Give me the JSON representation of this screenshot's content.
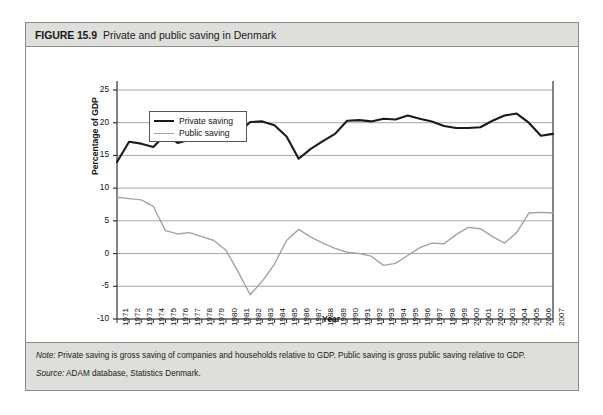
{
  "figure": {
    "number": "FIGURE 15.9",
    "title": "Private and public saving in Denmark",
    "note_label": "Note:",
    "note_text": " Private saving is gross saving of companies and households relative to GDP. Public saving is gross public saving relative to GDP.",
    "source_label": "Source:",
    "source_text": " ADAM database, Statistics Denmark."
  },
  "colors": {
    "private_line": "#1a1a1a",
    "public_line": "#a3a3a3",
    "gridline": "#a8a8a8",
    "axis": "#333333",
    "header_bg": "#dededa",
    "border": "#8c8c8c"
  },
  "chart_data": {
    "type": "line",
    "title": "Private and public saving in Denmark",
    "xlabel": "Year",
    "ylabel": "Percentage of GDP",
    "ylim": [
      -10,
      25
    ],
    "yticks": [
      25,
      20,
      15,
      10,
      5,
      0,
      -5,
      -10
    ],
    "grid": true,
    "legend_position": "top-left",
    "x": [
      1971,
      1972,
      1973,
      1974,
      1975,
      1976,
      1977,
      1978,
      1979,
      1980,
      1981,
      1982,
      1983,
      1984,
      1985,
      1986,
      1987,
      1988,
      1989,
      1990,
      1991,
      1992,
      1993,
      1994,
      1995,
      1996,
      1997,
      1998,
      1999,
      2000,
      2001,
      2002,
      2003,
      2004,
      2005,
      2006,
      2007
    ],
    "categories": [
      "1971",
      "1972",
      "1973",
      "1974",
      "1975",
      "1976",
      "1977",
      "1978",
      "1979",
      "1980",
      "1981",
      "1982",
      "1983",
      "1984",
      "1985",
      "1986",
      "1987",
      "1988",
      "1989",
      "1990",
      "1991",
      "1992",
      "1993",
      "1994",
      "1995",
      "1996",
      "1997",
      "1998",
      "1999",
      "2000",
      "2001",
      "2002",
      "2003",
      "2004",
      "2005",
      "2006",
      "2007"
    ],
    "series": [
      {
        "name": "Private saving",
        "color": "#1a1a1a",
        "values": [
          14.0,
          17.1,
          16.8,
          16.3,
          18.2,
          16.9,
          17.4,
          18.0,
          17.6,
          17.5,
          18.4,
          20.1,
          20.2,
          19.6,
          17.9,
          14.5,
          16.0,
          17.2,
          18.3,
          20.3,
          20.4,
          20.2,
          20.6,
          20.5,
          21.1,
          20.6,
          20.2,
          19.5,
          19.2,
          19.2,
          19.3,
          20.3,
          21.1,
          21.4,
          20.0,
          18.0,
          18.3
        ]
      },
      {
        "name": "Public saving",
        "color": "#a3a3a3",
        "values": [
          8.6,
          8.4,
          8.2,
          7.2,
          3.5,
          3.0,
          3.2,
          2.6,
          2.0,
          0.5,
          -2.8,
          -6.3,
          -4.2,
          -1.6,
          2.0,
          3.7,
          2.5,
          1.6,
          0.8,
          0.2,
          0.0,
          -0.4,
          -1.8,
          -1.5,
          -0.3,
          0.9,
          1.6,
          1.5,
          2.9,
          4.0,
          3.8,
          2.6,
          1.6,
          3.2,
          6.2,
          6.3,
          6.2
        ]
      }
    ]
  }
}
